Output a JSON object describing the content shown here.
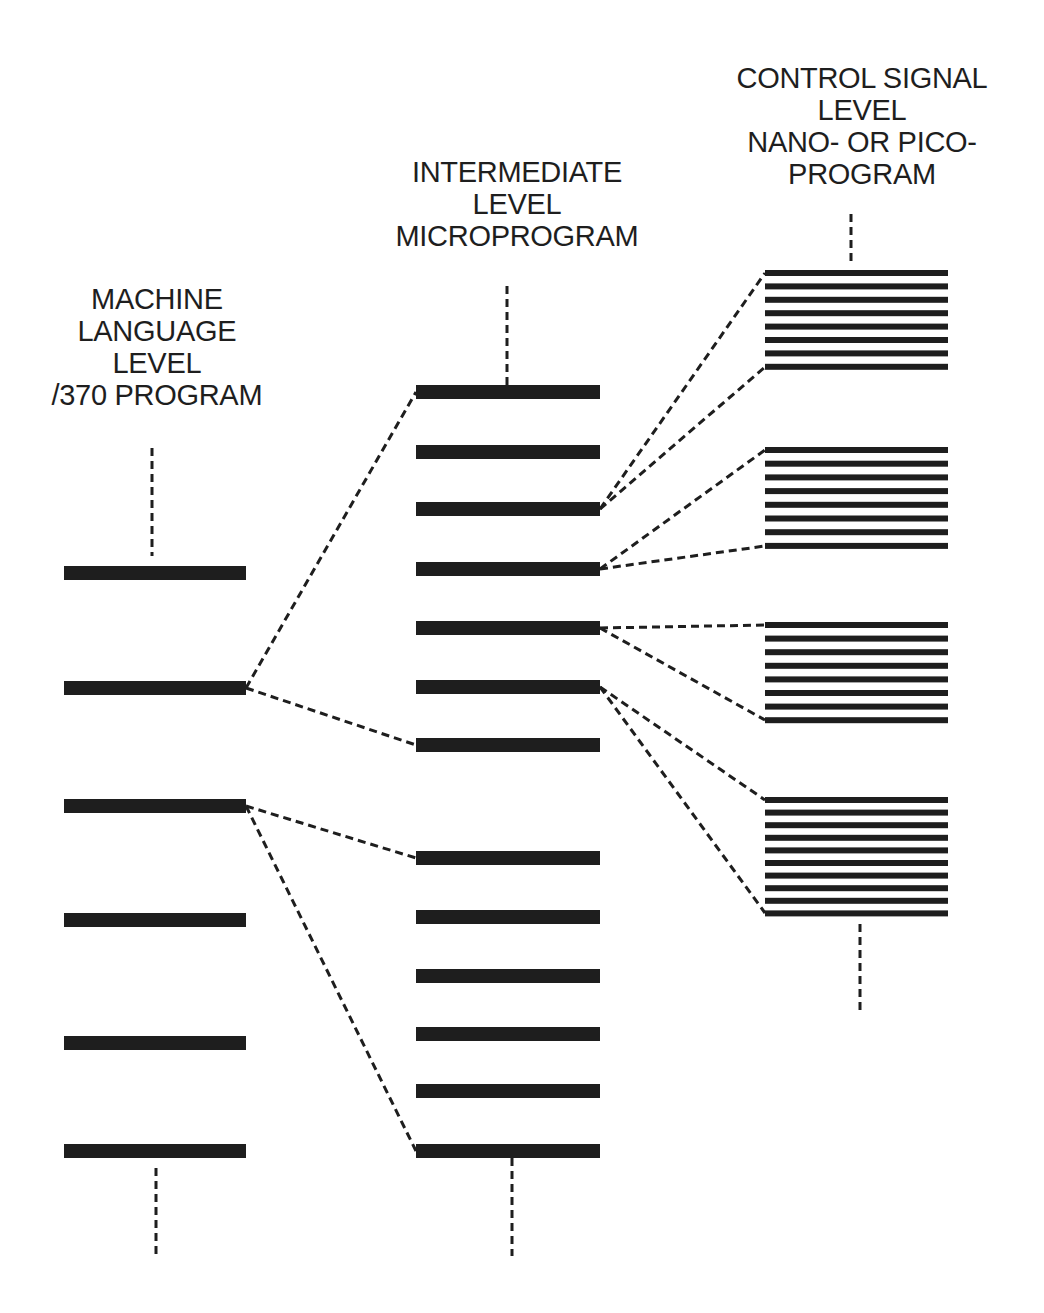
{
  "colors": {
    "ink": "#1e1e1e",
    "background": "#ffffff"
  },
  "levels": [
    {
      "id": "machine",
      "title_lines": [
        "MACHINE",
        "LANGUAGE",
        "LEVEL",
        "/370 PROGRAM"
      ],
      "label_center_x": 157,
      "label_top": 283,
      "stem": {
        "x": 152,
        "y1": 448,
        "y2": 556
      },
      "bottom_stem": {
        "x": 156,
        "y1": 1168,
        "y2": 1258
      },
      "bar_x1": 64,
      "bar_x2": 246,
      "bar_height": 14,
      "bars_y": [
        573,
        688,
        806,
        920,
        1043,
        1151
      ]
    },
    {
      "id": "intermediate",
      "title_lines": [
        "INTERMEDIATE",
        "LEVEL",
        "MICROPROGRAM"
      ],
      "label_center_x": 517,
      "label_top": 156,
      "stem": {
        "x": 507,
        "y1": 286,
        "y2": 385
      },
      "bottom_stem": {
        "x": 512,
        "y1": 1158,
        "y2": 1256
      },
      "bar_x1": 416,
      "bar_x2": 600,
      "bar_height": 14,
      "bars_y": [
        392,
        452,
        509,
        569,
        628,
        687,
        745,
        858,
        917,
        976,
        1034,
        1091,
        1151
      ]
    },
    {
      "id": "control",
      "title_lines": [
        "CONTROL SIGNAL",
        "LEVEL",
        "NANO- OR PICO-",
        "PROGRAM"
      ],
      "label_center_x": 862,
      "label_top": 62,
      "stem": {
        "x": 851,
        "y1": 214,
        "y2": 262
      },
      "bottom_stem": {
        "x": 860,
        "y1": 924,
        "y2": 1010
      },
      "bar_x1": 765,
      "bar_x2": 948,
      "bar_height": 6,
      "groups": [
        {
          "count": 8,
          "y_start": 273,
          "spacing": 13.4
        },
        {
          "count": 8,
          "y_start": 450,
          "spacing": 13.7
        },
        {
          "count": 8,
          "y_start": 625,
          "spacing": 13.6
        },
        {
          "count": 10,
          "y_start": 800,
          "spacing": 12.6
        }
      ]
    }
  ],
  "connectors": [
    {
      "from": [
        246,
        688
      ],
      "to": [
        416,
        392
      ]
    },
    {
      "from": [
        246,
        688
      ],
      "to": [
        416,
        745
      ]
    },
    {
      "from": [
        246,
        806
      ],
      "to": [
        416,
        858
      ]
    },
    {
      "from": [
        246,
        806
      ],
      "to": [
        416,
        1151
      ]
    },
    {
      "from": [
        600,
        509
      ],
      "to": [
        765,
        273
      ]
    },
    {
      "from": [
        600,
        509
      ],
      "to": [
        765,
        367
      ]
    },
    {
      "from": [
        600,
        569
      ],
      "to": [
        765,
        450
      ]
    },
    {
      "from": [
        600,
        569
      ],
      "to": [
        765,
        546
      ]
    },
    {
      "from": [
        600,
        628
      ],
      "to": [
        765,
        625
      ]
    },
    {
      "from": [
        600,
        628
      ],
      "to": [
        765,
        720
      ]
    },
    {
      "from": [
        600,
        687
      ],
      "to": [
        765,
        800
      ]
    },
    {
      "from": [
        600,
        687
      ],
      "to": [
        765,
        913
      ]
    }
  ]
}
